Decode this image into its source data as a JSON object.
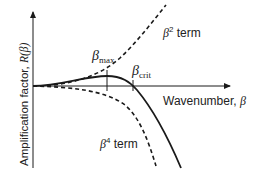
{
  "figure": {
    "y_axis_label": "Amplification factor, ",
    "y_axis_symbol": "R(β)",
    "x_axis_label": "Wavenumber, ",
    "x_axis_symbol": "β",
    "annotations": {
      "beta_max_symbol": "β",
      "beta_max_sub": "max",
      "beta_crit_symbol": "β",
      "beta_crit_sub": "crit",
      "beta2_symbol": "β",
      "beta2_sup": "2",
      "beta2_text": " term",
      "beta4_symbol": "β",
      "beta4_sup": "4",
      "beta4_text": " term"
    },
    "colors": {
      "line": "#1a1a1a",
      "background": "#ffffff"
    }
  }
}
